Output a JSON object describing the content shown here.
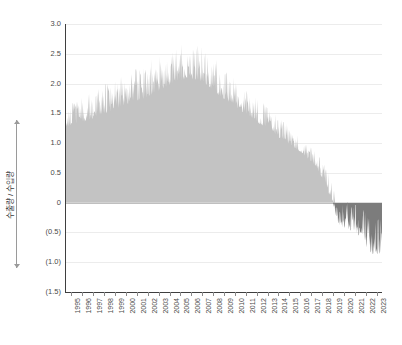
{
  "chart_data": {
    "type": "area",
    "title": "",
    "subtitle": "",
    "xlabel": "",
    "ylabel": "수출량 / 수입량",
    "ylim": [
      -1.5,
      3.0
    ],
    "xlim": [
      1995,
      2023
    ],
    "grid": true,
    "legend": "none",
    "y_ticks": [
      {
        "value": 3.0,
        "label": "3.0"
      },
      {
        "value": 2.5,
        "label": "2.5"
      },
      {
        "value": 2.0,
        "label": "2.0"
      },
      {
        "value": 1.5,
        "label": "1.5"
      },
      {
        "value": 1.0,
        "label": "1.0"
      },
      {
        "value": 0.5,
        "label": "0.5"
      },
      {
        "value": 0.0,
        "label": "0"
      },
      {
        "value": -0.5,
        "label": "(0.5)"
      },
      {
        "value": -1.0,
        "label": "(1.0)"
      },
      {
        "value": -1.5,
        "label": "(1.5)"
      }
    ],
    "x_ticks": [
      "1995",
      "1996",
      "1997",
      "1998",
      "1999",
      "2000",
      "2001",
      "2002",
      "2003",
      "2004",
      "2005",
      "2006",
      "2007",
      "2008",
      "2009",
      "2010",
      "2011",
      "2012",
      "2013",
      "2014",
      "2015",
      "2016",
      "2017",
      "2018",
      "2019",
      "2020",
      "2021",
      "2022",
      "2023"
    ],
    "colors": {
      "positive_fill": "#c3c3c3",
      "negative_fill": "#7c7c7c",
      "axis": "#3f3f3f",
      "gridline": "#ececec",
      "zero_line": "#bfbfbf",
      "text": "#4a4a4a"
    },
    "series": [
      {
        "name": "수출량 / 수입량",
        "note": "dense high-frequency observations; annual envelope listed as [year, low, high, mean]",
        "annual_envelope": [
          [
            1995,
            1.18,
            1.62,
            1.38
          ],
          [
            1996,
            1.25,
            1.72,
            1.45
          ],
          [
            1997,
            1.3,
            1.82,
            1.52
          ],
          [
            1998,
            1.36,
            1.92,
            1.6
          ],
          [
            1999,
            1.42,
            2.02,
            1.68
          ],
          [
            2000,
            1.5,
            2.12,
            1.78
          ],
          [
            2001,
            1.55,
            2.18,
            1.84
          ],
          [
            2002,
            1.62,
            2.3,
            1.92
          ],
          [
            2003,
            1.7,
            2.42,
            2.02
          ],
          [
            2004,
            1.8,
            2.52,
            2.12
          ],
          [
            2005,
            1.88,
            2.58,
            2.2
          ],
          [
            2006,
            1.95,
            2.68,
            2.28
          ],
          [
            2007,
            1.92,
            2.66,
            2.26
          ],
          [
            2008,
            1.85,
            2.55,
            2.16
          ],
          [
            2009,
            1.7,
            2.35,
            1.98
          ],
          [
            2010,
            1.58,
            2.18,
            1.84
          ],
          [
            2011,
            1.45,
            2.0,
            1.7
          ],
          [
            2012,
            1.32,
            1.82,
            1.55
          ],
          [
            2013,
            1.2,
            1.66,
            1.42
          ],
          [
            2014,
            1.08,
            1.5,
            1.28
          ],
          [
            2015,
            0.96,
            1.34,
            1.14
          ],
          [
            2016,
            0.84,
            1.18,
            1.0
          ],
          [
            2017,
            0.72,
            1.02,
            0.86
          ],
          [
            2018,
            0.52,
            0.86,
            0.68
          ],
          [
            2019,
            0.18,
            0.56,
            0.34
          ],
          [
            2020,
            -0.5,
            -0.02,
            -0.26
          ],
          [
            2021,
            -0.62,
            -0.05,
            -0.3
          ],
          [
            2022,
            -0.74,
            -0.08,
            -0.38
          ],
          [
            2023,
            -1.05,
            -0.3,
            -0.66
          ]
        ]
      }
    ]
  }
}
